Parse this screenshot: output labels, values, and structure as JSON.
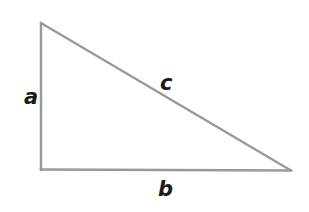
{
  "diagram": {
    "type": "right-triangle",
    "vertices": {
      "top": [
        41,
        23
      ],
      "right_angle": [
        41,
        169
      ],
      "right": [
        291,
        170
      ]
    },
    "stroke_color": "#9a9a9a",
    "stroke_width": 2.5,
    "label_color": "#1a1a1a",
    "labels": {
      "a": "a",
      "b": "b",
      "c": "c"
    },
    "label_positions": {
      "a": [
        30,
        104
      ],
      "b": [
        164,
        196
      ],
      "c": [
        166,
        90
      ]
    }
  }
}
